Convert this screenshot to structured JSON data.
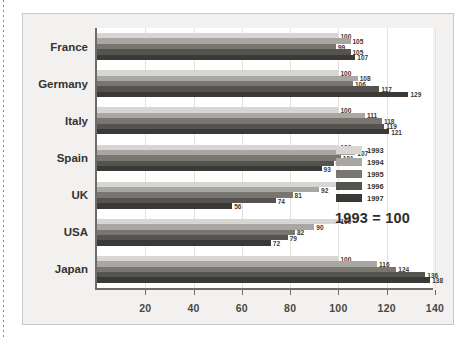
{
  "chart_data": {
    "type": "bar",
    "orientation": "horizontal",
    "title": "",
    "subtitle": "",
    "xlabel": "",
    "ylabel": "",
    "annotation": "1993 = 100",
    "xlim": [
      0,
      140
    ],
    "xticks": [
      20,
      40,
      60,
      80,
      100,
      120,
      140
    ],
    "xtick_labels": [
      "20",
      "40",
      "60",
      "80",
      "100",
      "120",
      "140"
    ],
    "grid": true,
    "legend_position": "right",
    "categories": [
      "France",
      "Germany",
      "Italy",
      "Spain",
      "UK",
      "USA",
      "Japan"
    ],
    "series": [
      {
        "name": "1993",
        "color": "#d8d6d2",
        "values": [
          100,
          100,
          100,
          100,
          100,
          100,
          100
        ]
      },
      {
        "name": "1994",
        "color": "#a9a7a3",
        "values": [
          105,
          108,
          111,
          107,
          92,
          90,
          116
        ]
      },
      {
        "name": "1995",
        "color": "#78766f",
        "values": [
          99,
          106,
          118,
          101,
          81,
          82,
          124
        ]
      },
      {
        "name": "1996",
        "color": "#555350",
        "values": [
          105,
          117,
          119,
          98,
          74,
          79,
          136
        ]
      },
      {
        "name": "1997",
        "color": "#3b3936",
        "values": [
          107,
          129,
          121,
          93,
          56,
          72,
          138
        ]
      }
    ]
  },
  "legend": {
    "items": [
      {
        "label": "1993"
      },
      {
        "label": "1994"
      },
      {
        "label": "1995"
      },
      {
        "label": "1996"
      },
      {
        "label": "1997"
      }
    ]
  },
  "note": {
    "text": "1993 = 100"
  },
  "colors": {
    "page_background": "#ffffff",
    "figure_background": "#f2f1ef",
    "plot_background": "#ffffff",
    "axis": "#6d6b68",
    "gridline": "#e3e1dd",
    "text": "#35332f"
  }
}
